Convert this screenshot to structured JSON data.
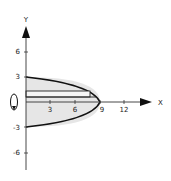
{
  "diagram": {
    "x_axis_label": "X",
    "y_axis_label": "Y",
    "x_ticks": [
      "3",
      "6",
      "9",
      "12"
    ],
    "y_ticks": [
      "6",
      "3",
      "-3",
      "-6"
    ],
    "curve": "x = 9 - y^2",
    "region_fill": "#e6e6e6",
    "curve_color": "#111111",
    "rotation_axis": "x-axis",
    "strip": {
      "y_low": 0.6,
      "y_high": 1.3
    }
  }
}
